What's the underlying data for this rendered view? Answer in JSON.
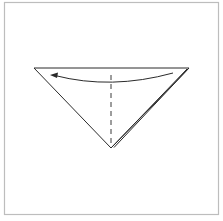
{
  "diagram": {
    "type": "origami-fold-step",
    "colors": {
      "background": "#ffffff",
      "frame": "#bdbdbd",
      "line": "#2a2a2a",
      "dashed": "#3a3a3a"
    },
    "frame": {
      "x": 4,
      "y": 2,
      "width": 215,
      "height": 213
    },
    "triangle": {
      "top_left": [
        34,
        68
      ],
      "top_right": [
        189,
        68
      ],
      "apex": [
        111,
        148
      ],
      "back_layer_apex": [
        114,
        147
      ]
    },
    "valley_fold_line": {
      "x": 111,
      "y1": 75,
      "y2": 145,
      "style": "dashed"
    },
    "fold_arrow": {
      "start": [
        173,
        73
      ],
      "control": [
        111,
        90
      ],
      "end": [
        51,
        75
      ],
      "direction": "right-to-left"
    }
  }
}
